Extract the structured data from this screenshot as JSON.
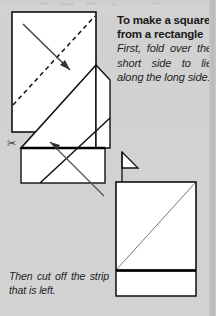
{
  "page": {
    "background_color": "#d2d2d2",
    "paper_color": "#ffffff",
    "ink_color": "#111111",
    "width": 216,
    "height": 316
  },
  "instructions": {
    "heading_line1": "To make a square",
    "heading_line2": "from a rectangle",
    "body": "First, fold over the short side to lie along the long side.",
    "caption": "Then cut off the strip that is left."
  },
  "icons": {
    "scissors": "✂"
  },
  "diagrams": [
    {
      "id": "step-1-rectangle",
      "label": "Rectangle with diagonal fold line and fold arrow",
      "shape": "rectangle",
      "fold_line_style": "dashed",
      "fold_line_from": "bottom-left",
      "fold_line_to": "top-right",
      "arrow": "fold short side down to long side",
      "rect": {
        "x": 12,
        "y": 12,
        "w": 84,
        "h": 120
      }
    },
    {
      "id": "step-2-folded",
      "label": "Folded sheet forming triangle over remaining strip, cut line marked with scissors",
      "shape": "folded-triangle-with-strip",
      "cut_line": "horizontal solid thick line",
      "arrow": "points to cut line",
      "strip_rect": {
        "x": 21,
        "y": 148,
        "w": 84,
        "h": 35
      }
    },
    {
      "id": "step-3-square",
      "label": "Resulting square with diagonal crease and cut-off strip below",
      "shape": "square-with-strip",
      "diagonal": "bottom-left to top-right",
      "square_rect": {
        "x": 116,
        "y": 182,
        "w": 80,
        "h": 88
      },
      "strip_rect": {
        "x": 116,
        "y": 271,
        "w": 80,
        "h": 25
      }
    }
  ]
}
